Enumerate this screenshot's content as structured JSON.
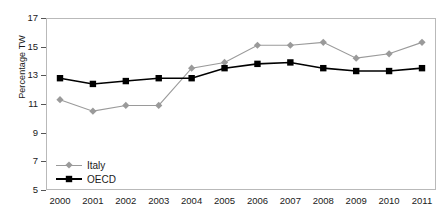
{
  "chart_data": {
    "type": "line",
    "title": "",
    "xlabel": "",
    "ylabel": "Percentage TW",
    "categories": [
      "2000",
      "2001",
      "2002",
      "2003",
      "2004",
      "2005",
      "2006",
      "2007",
      "2008",
      "2009",
      "2010",
      "2011"
    ],
    "x": [
      2000,
      2001,
      2002,
      2003,
      2004,
      2005,
      2006,
      2007,
      2008,
      2009,
      2010,
      2011
    ],
    "ylim": [
      5,
      17
    ],
    "yticks": [
      5,
      7,
      9,
      11,
      13,
      15,
      17
    ],
    "grid": false,
    "legend_position": "bottom-left",
    "series": [
      {
        "name": "Italy",
        "color": "#9a9a9a",
        "marker": "diamond",
        "values": [
          11.3,
          10.5,
          10.9,
          10.9,
          13.5,
          13.9,
          15.1,
          15.1,
          15.3,
          14.2,
          14.5,
          15.3
        ]
      },
      {
        "name": "OECD",
        "color": "#000000",
        "marker": "square",
        "values": [
          12.8,
          12.4,
          12.6,
          12.8,
          12.8,
          13.5,
          13.8,
          13.9,
          13.5,
          13.3,
          13.3,
          13.5
        ]
      }
    ]
  },
  "legend": {
    "items": [
      {
        "label": "Italy"
      },
      {
        "label": "OECD"
      }
    ]
  },
  "axis": {
    "y_title": "Percentage TW"
  }
}
